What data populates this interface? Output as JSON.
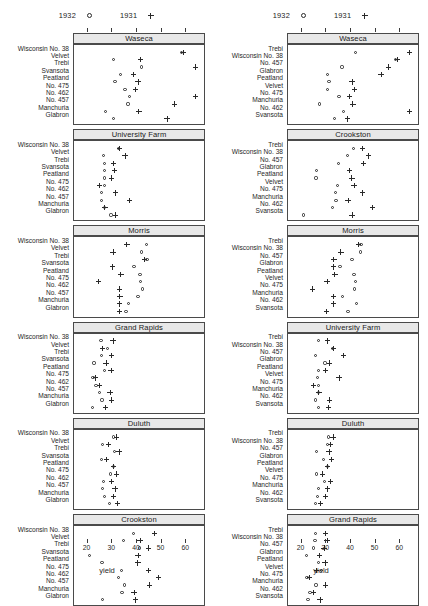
{
  "legend": {
    "entries": [
      {
        "label": "1932",
        "symbol": "circle-marker"
      },
      {
        "label": "1931",
        "symbol": "plus-marker"
      }
    ]
  },
  "axis": {
    "xlabel": "yield",
    "ticks": [
      20,
      30,
      40,
      50,
      60
    ],
    "xlim": [
      14.5,
      68.0
    ]
  },
  "chart_data": {
    "type": "scatter",
    "title": "",
    "xlabel": "yield",
    "ylabel": "",
    "xlim": [
      14.5,
      68.0
    ],
    "grid": false,
    "legend_position": "top",
    "series": [
      {
        "name": "1932",
        "marker": "circle"
      },
      {
        "name": "1931",
        "marker": "plus"
      }
    ],
    "panel_columns": [
      {
        "column": "left",
        "ordering": "site-default",
        "panels": [
          {
            "site": "Waseca",
            "rows": [
              {
                "variety": "Wisconsin No. 38",
                "y1932": 58.17,
                "y1931": 58.8
              },
              {
                "variety": "Velvet",
                "y1932": 30.53,
                "y1931": 41.5
              },
              {
                "variety": "Trebi",
                "y1932": 41.87,
                "y1931": 63.84
              },
              {
                "variety": "Svansota",
                "y1932": 33.46,
                "y1931": 38.5
              },
              {
                "variety": "Peatland",
                "y1932": 31.08,
                "y1931": 40.47
              },
              {
                "variety": "No. 475",
                "y1932": 35.14,
                "y1931": 39.3
              },
              {
                "variety": "No. 462",
                "y1932": 37.0,
                "y1931": 63.77
              },
              {
                "variety": "No. 457",
                "y1932": 36.4,
                "y1931": 55.2
              },
              {
                "variety": "Manchuria",
                "y1932": 27.43,
                "y1931": 40.8
              },
              {
                "variety": "Glabron",
                "y1932": 30.5,
                "y1931": 52.17
              }
            ]
          },
          {
            "site": "University Farm",
            "rows": [
              {
                "variety": "Wisconsin No. 38",
                "y1932": 32.7,
                "y1931": 33.0
              },
              {
                "variety": "Velvet",
                "y1932": 26.3,
                "y1931": 35.13
              },
              {
                "variety": "Trebi",
                "y1932": 27.0,
                "y1931": 30.6
              },
              {
                "variety": "Svansota",
                "y1932": 26.8,
                "y1931": 31.0
              },
              {
                "variety": "Peatland",
                "y1932": 26.9,
                "y1931": 29.77
              },
              {
                "variety": "No. 475",
                "y1932": 26.9,
                "y1931": 24.93
              },
              {
                "variety": "No. 462",
                "y1932": 25.57,
                "y1931": 31.27
              },
              {
                "variety": "No. 457",
                "y1932": 25.7,
                "y1931": 37.0
              },
              {
                "variety": "Manchuria",
                "y1932": 26.9,
                "y1931": 27.0
              },
              {
                "variety": "Glabron",
                "y1932": 29.5,
                "y1931": 31.3
              }
            ]
          },
          {
            "site": "Morris",
            "rows": [
              {
                "variety": "Wisconsin No. 38",
                "y1932": 43.87,
                "y1931": 35.9
              },
              {
                "variety": "Velvet",
                "y1932": 41.8,
                "y1931": 30.27
              },
              {
                "variety": "Trebi",
                "y1932": 44.1,
                "y1931": 43.07
              },
              {
                "variety": "Svansota",
                "y1932": 38.83,
                "y1931": 30.0
              },
              {
                "variety": "Peatland",
                "y1932": 41.27,
                "y1931": 33.47
              },
              {
                "variety": "No. 475",
                "y1932": 41.4,
                "y1931": 24.5
              },
              {
                "variety": "No. 462",
                "y1932": 42.2,
                "y1931": 32.97
              },
              {
                "variety": "No. 457",
                "y1932": 40.47,
                "y1931": 33.07
              },
              {
                "variety": "Manchuria",
                "y1932": 36.6,
                "y1931": 32.97
              },
              {
                "variety": "Glabron",
                "y1932": 35.57,
                "y1931": 33.0
              }
            ]
          },
          {
            "site": "Grand Rapids",
            "rows": [
              {
                "variety": "Wisconsin No. 38",
                "y1932": 25.43,
                "y1931": 30.27
              },
              {
                "variety": "Velvet",
                "y1932": 28.1,
                "y1931": 26.1
              },
              {
                "variety": "Trebi",
                "y1932": 25.7,
                "y1931": 29.67
              },
              {
                "variety": "Svansota",
                "y1932": 22.6,
                "y1931": 27.43
              },
              {
                "variety": "Peatland",
                "y1932": 26.8,
                "y1931": 29.5
              },
              {
                "variety": "No. 475",
                "y1932": 22.23,
                "y1931": 23.1
              },
              {
                "variety": "No. 462",
                "y1932": 23.4,
                "y1931": 24.87
              },
              {
                "variety": "No. 457",
                "y1932": 24.93,
                "y1931": 29.13
              },
              {
                "variety": "Manchuria",
                "y1932": 25.87,
                "y1931": 29.77
              },
              {
                "variety": "Glabron",
                "y1932": 22.0,
                "y1931": 27.37
              }
            ]
          },
          {
            "site": "Duluth",
            "rows": [
              {
                "variety": "Wisconsin No. 38",
                "y1932": 30.6,
                "y1931": 31.6
              },
              {
                "variety": "Velvet",
                "y1932": 26.0,
                "y1931": 28.57
              },
              {
                "variety": "Trebi",
                "y1932": 30.8,
                "y1931": 32.77
              },
              {
                "variety": "Svansota",
                "y1932": 25.5,
                "y1931": 27.67
              },
              {
                "variety": "Peatland",
                "y1932": 30.6,
                "y1931": 30.53
              },
              {
                "variety": "No. 475",
                "y1932": 29.33,
                "y1931": 31.6
              },
              {
                "variety": "No. 462",
                "y1932": 26.4,
                "y1931": 29.67
              },
              {
                "variety": "No. 457",
                "y1932": 26.0,
                "y1931": 31.1
              },
              {
                "variety": "Manchuria",
                "y1932": 26.77,
                "y1931": 30.53
              },
              {
                "variety": "Glabron",
                "y1932": 28.77,
                "y1931": 32.07
              }
            ]
          },
          {
            "site": "Crookston",
            "rows": [
              {
                "variety": "Wisconsin No. 38",
                "y1932": 38.5,
                "y1931": 47.17
              },
              {
                "variety": "Velvet",
                "y1932": 34.7,
                "y1931": 41.27
              },
              {
                "variety": "Trebi",
                "y1932": 41.13,
                "y1931": 44.67
              },
              {
                "variety": "Svansota",
                "y1932": 20.63,
                "y1931": 40.47
              },
              {
                "variety": "Peatland",
                "y1932": 25.87,
                "y1931": 40.37
              },
              {
                "variety": "No. 475",
                "y1932": 33.63,
                "y1931": 44.77
              },
              {
                "variety": "No. 462",
                "y1932": 32.4,
                "y1931": 48.83
              },
              {
                "variety": "No. 457",
                "y1932": 35.13,
                "y1931": 45.0
              },
              {
                "variety": "Manchuria",
                "y1932": 33.93,
                "y1931": 38.83
              },
              {
                "variety": "Glabron",
                "y1932": 26.13,
                "y1931": 39.37
              }
            ]
          }
        ]
      },
      {
        "column": "right",
        "ordering": "median-sorted",
        "panels": [
          {
            "site": "Waseca",
            "rows": [
              {
                "variety": "Trebi",
                "y1932": 41.87,
                "y1931": 63.84
              },
              {
                "variety": "Wisconsin No. 38",
                "y1932": 58.17,
                "y1931": 58.8
              },
              {
                "variety": "No. 457",
                "y1932": 36.4,
                "y1931": 55.2
              },
              {
                "variety": "Glabron",
                "y1932": 30.5,
                "y1931": 52.17
              },
              {
                "variety": "Peatland",
                "y1932": 31.08,
                "y1931": 40.47
              },
              {
                "variety": "Velvet",
                "y1932": 30.53,
                "y1931": 41.5
              },
              {
                "variety": "No. 475",
                "y1932": 35.14,
                "y1931": 39.3
              },
              {
                "variety": "Manchuria",
                "y1932": 27.43,
                "y1931": 40.8
              },
              {
                "variety": "No. 462",
                "y1932": 37.0,
                "y1931": 63.77
              },
              {
                "variety": "Svansota",
                "y1932": 33.46,
                "y1931": 38.5
              }
            ]
          },
          {
            "site": "Crookston",
            "rows": [
              {
                "variety": "Trebi",
                "y1932": 41.13,
                "y1931": 44.67
              },
              {
                "variety": "Wisconsin No. 38",
                "y1932": 38.5,
                "y1931": 47.17
              },
              {
                "variety": "No. 457",
                "y1932": 35.13,
                "y1931": 45.0
              },
              {
                "variety": "Glabron",
                "y1932": 26.13,
                "y1931": 39.37
              },
              {
                "variety": "Peatland",
                "y1932": 25.87,
                "y1931": 40.37
              },
              {
                "variety": "Velvet",
                "y1932": 34.7,
                "y1931": 41.27
              },
              {
                "variety": "No. 475",
                "y1932": 33.63,
                "y1931": 44.77
              },
              {
                "variety": "Manchuria",
                "y1932": 33.93,
                "y1931": 38.83
              },
              {
                "variety": "No. 462",
                "y1932": 32.4,
                "y1931": 48.83
              },
              {
                "variety": "Svansota",
                "y1932": 20.63,
                "y1931": 40.47
              }
            ]
          },
          {
            "site": "Morris",
            "rows": [
              {
                "variety": "Trebi",
                "y1932": 44.1,
                "y1931": 43.07
              },
              {
                "variety": "Wisconsin No. 38",
                "y1932": 43.87,
                "y1931": 35.9
              },
              {
                "variety": "No. 457",
                "y1932": 40.47,
                "y1931": 33.07
              },
              {
                "variety": "Glabron",
                "y1932": 35.57,
                "y1931": 33.0
              },
              {
                "variety": "Peatland",
                "y1932": 41.27,
                "y1931": 33.47
              },
              {
                "variety": "Velvet",
                "y1932": 41.8,
                "y1931": 30.27
              },
              {
                "variety": "No. 475",
                "y1932": 41.4,
                "y1931": 24.5
              },
              {
                "variety": "Manchuria",
                "y1932": 36.6,
                "y1931": 32.97
              },
              {
                "variety": "No. 462",
                "y1932": 42.2,
                "y1931": 32.97
              },
              {
                "variety": "Svansota",
                "y1932": 38.83,
                "y1931": 30.0
              }
            ]
          },
          {
            "site": "University Farm",
            "rows": [
              {
                "variety": "Trebi",
                "y1932": 27.0,
                "y1931": 30.6
              },
              {
                "variety": "Wisconsin No. 38",
                "y1932": 32.7,
                "y1931": 33.0
              },
              {
                "variety": "No. 457",
                "y1932": 25.7,
                "y1931": 37.0
              },
              {
                "variety": "Glabron",
                "y1932": 29.5,
                "y1931": 31.3
              },
              {
                "variety": "Peatland",
                "y1932": 26.9,
                "y1931": 29.77
              },
              {
                "variety": "Velvet",
                "y1932": 26.3,
                "y1931": 35.13
              },
              {
                "variety": "No. 475",
                "y1932": 26.9,
                "y1931": 24.93
              },
              {
                "variety": "Manchuria",
                "y1932": 26.9,
                "y1931": 27.0
              },
              {
                "variety": "No. 462",
                "y1932": 25.57,
                "y1931": 31.27
              },
              {
                "variety": "Svansota",
                "y1932": 26.8,
                "y1931": 31.0
              }
            ]
          },
          {
            "site": "Duluth",
            "rows": [
              {
                "variety": "Trebi",
                "y1932": 30.8,
                "y1931": 32.77
              },
              {
                "variety": "Wisconsin No. 38",
                "y1932": 30.6,
                "y1931": 31.6
              },
              {
                "variety": "No. 457",
                "y1932": 26.0,
                "y1931": 31.1
              },
              {
                "variety": "Glabron",
                "y1932": 28.77,
                "y1931": 32.07
              },
              {
                "variety": "Peatland",
                "y1932": 30.6,
                "y1931": 30.53
              },
              {
                "variety": "Velvet",
                "y1932": 26.0,
                "y1931": 28.57
              },
              {
                "variety": "No. 475",
                "y1932": 29.33,
                "y1931": 31.6
              },
              {
                "variety": "Manchuria",
                "y1932": 26.77,
                "y1931": 30.53
              },
              {
                "variety": "No. 462",
                "y1932": 26.4,
                "y1931": 29.67
              },
              {
                "variety": "Svansota",
                "y1932": 25.5,
                "y1931": 27.67
              }
            ]
          },
          {
            "site": "Grand Rapids",
            "rows": [
              {
                "variety": "Trebi",
                "y1932": 25.7,
                "y1931": 29.67
              },
              {
                "variety": "Wisconsin No. 38",
                "y1932": 25.43,
                "y1931": 30.27
              },
              {
                "variety": "No. 457",
                "y1932": 24.93,
                "y1931": 29.13
              },
              {
                "variety": "Glabron",
                "y1932": 22.0,
                "y1931": 27.37
              },
              {
                "variety": "Peatland",
                "y1932": 26.8,
                "y1931": 29.5
              },
              {
                "variety": "Velvet",
                "y1932": 28.1,
                "y1931": 26.1
              },
              {
                "variety": "No. 475",
                "y1932": 22.23,
                "y1931": 23.1
              },
              {
                "variety": "Manchuria",
                "y1932": 25.87,
                "y1931": 29.77
              },
              {
                "variety": "No. 462",
                "y1932": 23.4,
                "y1931": 24.87
              },
              {
                "variety": "Svansota",
                "y1932": 22.6,
                "y1931": 27.43
              }
            ]
          }
        ]
      }
    ]
  }
}
